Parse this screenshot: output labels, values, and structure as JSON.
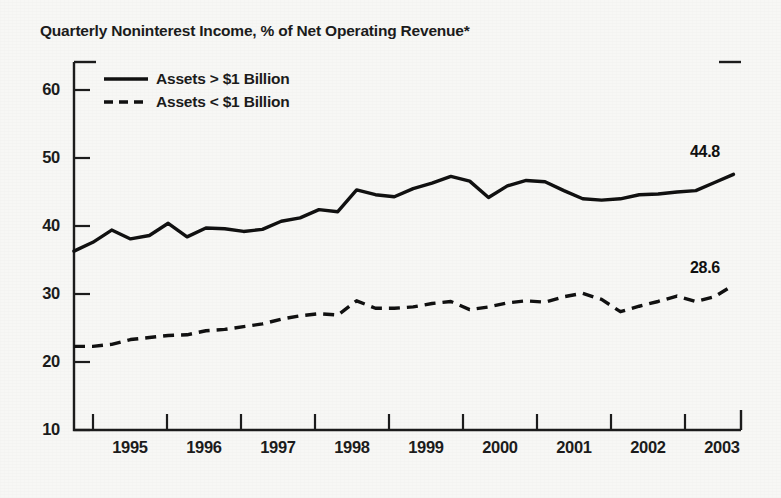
{
  "chart_data": {
    "type": "line",
    "title": "Quarterly Noninterest Income, % of Net Operating Revenue*",
    "xlabel": "",
    "ylabel": "",
    "ylim": [
      10,
      62
    ],
    "xlim": [
      1994.75,
      2003.6
    ],
    "grid": false,
    "legend_position": "top-left",
    "yticks": [
      10,
      20,
      30,
      40,
      50,
      60
    ],
    "ytick_labels": [
      "10",
      "20",
      "30",
      "40",
      "50",
      "60"
    ],
    "xticks": [
      1995,
      1996,
      1997,
      1998,
      1999,
      2000,
      2001,
      2002,
      2003
    ],
    "xtick_labels": [
      "1995",
      "1996",
      "1997",
      "1998",
      "1999",
      "2000",
      "2001",
      "2002",
      "2003"
    ],
    "x": [
      1994.75,
      1995.0,
      1995.25,
      1995.5,
      1995.75,
      1996.0,
      1996.25,
      1996.5,
      1996.75,
      1997.0,
      1997.25,
      1997.5,
      1997.75,
      1998.0,
      1998.25,
      1998.5,
      1998.75,
      1999.0,
      1999.25,
      1999.5,
      1999.75,
      2000.0,
      2000.25,
      2000.5,
      2000.75,
      2001.0,
      2001.25,
      2001.5,
      2001.75,
      2002.0,
      2002.25,
      2002.5,
      2002.75,
      2003.0,
      2003.25,
      2003.5
    ],
    "series": [
      {
        "name": "Assets > $1 Billion",
        "style": "solid",
        "color": "#111111",
        "end_label": "44.8",
        "values": [
          36.3,
          37.6,
          39.4,
          38.1,
          38.6,
          40.4,
          38.4,
          39.7,
          39.6,
          39.2,
          39.5,
          40.7,
          41.2,
          42.4,
          42.1,
          45.3,
          44.6,
          44.3,
          45.5,
          46.3,
          47.3,
          46.6,
          44.2,
          45.9,
          46.7,
          46.5,
          45.2,
          44.0,
          43.8,
          44.0,
          44.6,
          44.7,
          45.0,
          45.2,
          46.4,
          47.6
        ]
      },
      {
        "name": "Assets < $1 Billion",
        "style": "dashed",
        "color": "#111111",
        "end_label": "28.6",
        "values": [
          22.3,
          22.3,
          22.6,
          23.3,
          23.6,
          23.9,
          24.0,
          24.6,
          24.8,
          25.2,
          25.6,
          26.3,
          26.8,
          27.1,
          26.9,
          29.0,
          27.9,
          27.9,
          28.1,
          28.6,
          28.9,
          27.7,
          28.1,
          28.7,
          29.0,
          28.8,
          29.6,
          30.1,
          29.2,
          27.4,
          28.2,
          28.9,
          29.7,
          28.9,
          29.6,
          31.3
        ]
      }
    ],
    "footnote_marker": "*"
  },
  "legend": {
    "items": [
      {
        "label": "Assets > $1 Billion",
        "style": "solid"
      },
      {
        "label": "Assets < $1 Billion",
        "style": "dashed"
      }
    ]
  },
  "endpoint_labels": {
    "large_banks": "44.8",
    "small_banks": "28.6"
  }
}
